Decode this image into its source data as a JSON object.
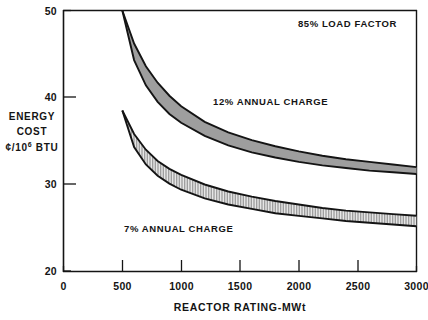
{
  "chart_data": {
    "type": "area",
    "title": "",
    "xlabel": "REACTOR RATING-MWt",
    "ylabel_lines": [
      "ENERGY",
      "COST",
      "¢/10",
      "6",
      " BTU"
    ],
    "ylabel_text": "ENERGY COST ¢/10⁶ BTU",
    "xlim": [
      0,
      3000
    ],
    "ylim": [
      20,
      50
    ],
    "xticks": [
      0,
      500,
      1000,
      1500,
      2000,
      2500,
      3000
    ],
    "xtick_labels": [
      "0",
      "500",
      "1000",
      "1500",
      "2000",
      "2500",
      "3000"
    ],
    "yticks": [
      20,
      30,
      40,
      50
    ],
    "ytick_labels": [
      "20",
      "30",
      "40",
      "50"
    ],
    "grid": false,
    "legend_position": "in-plot annotations",
    "annotations": [
      {
        "id": "load-factor",
        "text": "85% LOAD FACTOR",
        "x": 2350,
        "y": 48.2
      },
      {
        "id": "band-12-label",
        "text": "12% ANNUAL CHARGE",
        "x": 1520,
        "y": 38.9
      },
      {
        "id": "band-7-label",
        "text": "7% ANNUAL CHARGE",
        "x": 1020,
        "y": 26.3
      }
    ],
    "series": [
      {
        "name": "12% ANNUAL CHARGE",
        "fill": "solid-gray",
        "color": "#9e9e9e",
        "x": [
          500,
          600,
          700,
          800,
          900,
          1000,
          1200,
          1400,
          1600,
          1800,
          2000,
          2200,
          2400,
          2600,
          2800,
          3000
        ],
        "upper": [
          50.0,
          46.2,
          43.6,
          41.7,
          40.2,
          39.0,
          37.2,
          36.0,
          35.1,
          34.4,
          33.8,
          33.3,
          32.9,
          32.6,
          32.3,
          32.0
        ],
        "lower": [
          50.0,
          44.3,
          41.4,
          39.5,
          38.1,
          37.1,
          35.6,
          34.5,
          33.7,
          33.1,
          32.6,
          32.2,
          31.9,
          31.6,
          31.4,
          31.2
        ]
      },
      {
        "name": "7% ANNUAL CHARGE",
        "fill": "vertical-hatch",
        "color": "#d8d8d8",
        "x": [
          500,
          600,
          700,
          800,
          900,
          1000,
          1200,
          1400,
          1600,
          1800,
          2000,
          2200,
          2400,
          2600,
          2800,
          3000
        ],
        "upper": [
          38.5,
          35.8,
          34.0,
          32.7,
          31.8,
          31.1,
          30.0,
          29.2,
          28.6,
          28.1,
          27.7,
          27.3,
          27.0,
          26.8,
          26.6,
          26.4
        ],
        "lower": [
          38.5,
          34.3,
          32.3,
          31.0,
          30.1,
          29.4,
          28.4,
          27.7,
          27.2,
          26.7,
          26.4,
          26.1,
          25.8,
          25.6,
          25.4,
          25.2
        ]
      }
    ]
  },
  "colors": {
    "axis": "#141414",
    "text": "#141414",
    "band_12_fill": "#9e9e9e",
    "band_7_fill": "#e0e0e0",
    "band_outline": "#141414",
    "background": "#ffffff"
  }
}
